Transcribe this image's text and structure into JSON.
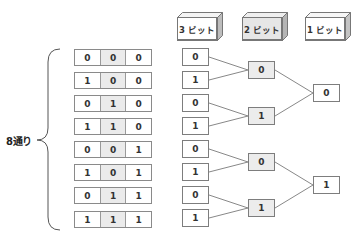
{
  "headers": [
    {
      "label": "3 ビット",
      "fill": "#ffffff"
    },
    {
      "label": "2 ビット",
      "fill": "#e6e6e6"
    },
    {
      "label": "1 ビット",
      "fill": "#ffffff"
    }
  ],
  "brace_label": "8通り",
  "combinations": [
    [
      "0",
      "0",
      "0"
    ],
    [
      "1",
      "0",
      "0"
    ],
    [
      "0",
      "1",
      "0"
    ],
    [
      "1",
      "1",
      "0"
    ],
    [
      "0",
      "0",
      "1"
    ],
    [
      "1",
      "0",
      "1"
    ],
    [
      "0",
      "1",
      "1"
    ],
    [
      "1",
      "1",
      "1"
    ]
  ],
  "tree": {
    "bit3": [
      "0",
      "1",
      "0",
      "1",
      "0",
      "1",
      "0",
      "1"
    ],
    "bit2": [
      "0",
      "1",
      "0",
      "1"
    ],
    "bit1": [
      "0",
      "1"
    ]
  },
  "colors": {
    "border": "#7d7d7d",
    "shade": "#ebebeb",
    "line": "#888888"
  }
}
